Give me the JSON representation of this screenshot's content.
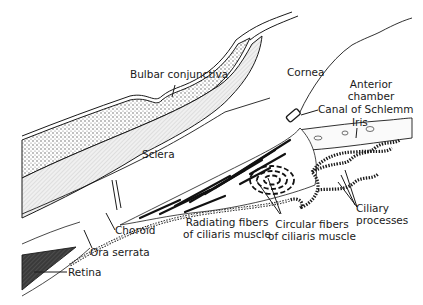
{
  "diagram": {
    "title": "",
    "colors": {
      "ink": "#1a1a1a",
      "sclera_fill": "#e6e6e6",
      "conjunctiva_fill": "#cfcfcf",
      "retina_fill": "#4a4a4a",
      "background": "#ffffff"
    },
    "labels": {
      "bulbar_conjunctiva": "Bulbar conjunctiva",
      "cornea": "Cornea",
      "anterior_chamber_1": "Anterior",
      "anterior_chamber_2": "chamber",
      "canal_of_schlemm": "Canal of Schlemm",
      "iris": "Iris",
      "sclera": "Sclera",
      "choroid": "Choroid",
      "ora_serrata": "Ora serrata",
      "retina": "Retina",
      "radiating_fibers_1": "Radiating fibers",
      "radiating_fibers_2": "of ciliaris muscle",
      "circular_fibers_1": "Circular fibers",
      "circular_fibers_2": "of ciliaris muscle",
      "ciliary_processes_1": "Ciliary",
      "ciliary_processes_2": "processes"
    }
  }
}
